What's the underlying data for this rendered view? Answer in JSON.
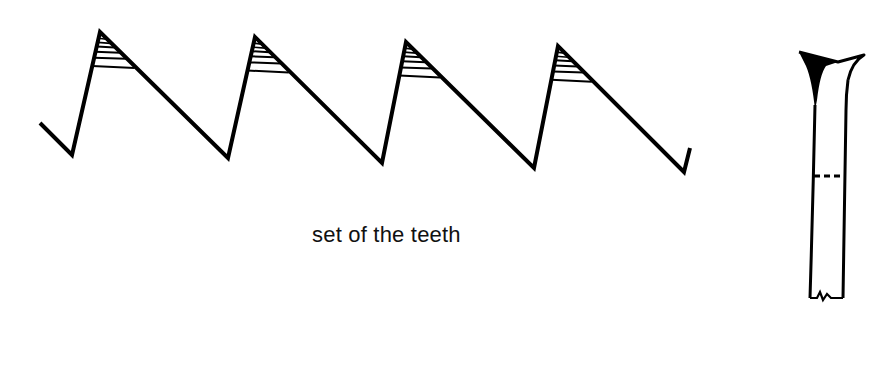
{
  "diagram": {
    "caption": "set of the teeth",
    "stroke_color": "#000000",
    "background": "#ffffff",
    "saw_teeth": {
      "count": 4,
      "path": [
        [
          40,
          123
        ],
        [
          72,
          155
        ],
        [
          100,
          32
        ],
        [
          228,
          158
        ],
        [
          255,
          37
        ],
        [
          382,
          163
        ],
        [
          406,
          42
        ],
        [
          534,
          168
        ],
        [
          558,
          46
        ],
        [
          684,
          172
        ],
        [
          690,
          148
        ]
      ],
      "teeth": [
        {
          "peak": [
            100,
            32
          ],
          "front_base": [
            72,
            155
          ],
          "back_base": [
            228,
            158
          ]
        },
        {
          "peak": [
            255,
            37
          ],
          "front_base": [
            228,
            158
          ],
          "back_base": [
            382,
            163
          ]
        },
        {
          "peak": [
            406,
            42
          ],
          "front_base": [
            382,
            163
          ],
          "back_base": [
            534,
            168
          ]
        },
        {
          "peak": [
            558,
            46
          ],
          "front_base": [
            534,
            168
          ],
          "back_base": [
            684,
            172
          ]
        }
      ],
      "hatch_fractions": [
        0.12,
        0.2,
        0.28,
        0.38,
        0.5,
        0.66
      ]
    },
    "tooth_side_view": {
      "label": "side view of tooth showing set",
      "dashed_line": true
    }
  }
}
